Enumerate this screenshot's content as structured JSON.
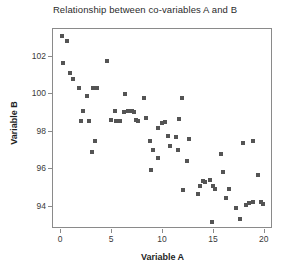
{
  "chart_data": {
    "type": "scatter",
    "title": "Relationship between co-variables A and B",
    "xlabel": "Variable A",
    "ylabel": "Variable B",
    "xlim": [
      -0.8,
      20.8
    ],
    "ylim": [
      92.8,
      103.5
    ],
    "xticks": [
      0,
      5,
      10,
      15,
      20
    ],
    "yticks": [
      94,
      96,
      98,
      100,
      102
    ],
    "xtick_labels": [
      "0",
      "5",
      "10",
      "15",
      "20"
    ],
    "ytick_labels": [
      "94",
      "96",
      "98",
      "100",
      "102"
    ],
    "grid": false,
    "legend": null,
    "marker": "square",
    "marker_color": "#545454",
    "marker_size": 4,
    "frame_color": "#8a8a8a",
    "background": "#ffffff",
    "series": [
      {
        "name": "A vs B",
        "points": [
          [
            0.1,
            103.1
          ],
          [
            0.6,
            102.85
          ],
          [
            0.2,
            101.7
          ],
          [
            0.9,
            101.15
          ],
          [
            1.2,
            100.85
          ],
          [
            1.8,
            100.35
          ],
          [
            2.5,
            99.9
          ],
          [
            2.1,
            99.1
          ],
          [
            1.9,
            98.6
          ],
          [
            2.7,
            98.6
          ],
          [
            3.1,
            100.35
          ],
          [
            3.5,
            100.35
          ],
          [
            3.3,
            97.5
          ],
          [
            3.0,
            96.9
          ],
          [
            4.5,
            101.8
          ],
          [
            4.9,
            98.65
          ],
          [
            5.3,
            99.1
          ],
          [
            5.4,
            98.6
          ],
          [
            5.8,
            98.6
          ],
          [
            6.3,
            100.0
          ],
          [
            6.2,
            99.05
          ],
          [
            6.6,
            99.1
          ],
          [
            7.0,
            99.1
          ],
          [
            7.2,
            99.05
          ],
          [
            7.3,
            98.65
          ],
          [
            7.5,
            98.6
          ],
          [
            8.1,
            99.8
          ],
          [
            8.3,
            98.75
          ],
          [
            8.7,
            97.5
          ],
          [
            9.0,
            97.05
          ],
          [
            8.85,
            95.95
          ],
          [
            9.5,
            96.6
          ],
          [
            9.55,
            98.2
          ],
          [
            9.9,
            98.45
          ],
          [
            10.2,
            98.5
          ],
          [
            10.5,
            97.75
          ],
          [
            10.7,
            97.25
          ],
          [
            11.3,
            97.7
          ],
          [
            11.6,
            98.7
          ],
          [
            11.9,
            99.8
          ],
          [
            11.5,
            97.0
          ],
          [
            12.4,
            96.45
          ],
          [
            12.6,
            97.6
          ],
          [
            12.0,
            94.9
          ],
          [
            13.4,
            94.65
          ],
          [
            13.6,
            95.1
          ],
          [
            13.9,
            95.35
          ],
          [
            14.1,
            95.3
          ],
          [
            14.6,
            95.4
          ],
          [
            14.9,
            95.1
          ],
          [
            15.1,
            94.95
          ],
          [
            14.8,
            93.15
          ],
          [
            15.7,
            96.8
          ],
          [
            15.9,
            95.85
          ],
          [
            16.2,
            94.45
          ],
          [
            16.5,
            94.95
          ],
          [
            17.2,
            93.9
          ],
          [
            17.6,
            93.35
          ],
          [
            17.9,
            97.4
          ],
          [
            18.8,
            97.5
          ],
          [
            18.1,
            94.1
          ],
          [
            18.4,
            94.2
          ],
          [
            18.8,
            94.25
          ],
          [
            19.3,
            95.7
          ],
          [
            19.6,
            94.25
          ],
          [
            19.8,
            94.15
          ]
        ]
      }
    ]
  }
}
